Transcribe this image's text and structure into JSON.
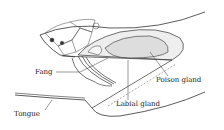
{
  "diagram": {
    "labels": {
      "fang": "Fang",
      "poison_gland": "Poison gland",
      "labial_gland": "Labial gland",
      "tongue": "Tongue"
    }
  }
}
